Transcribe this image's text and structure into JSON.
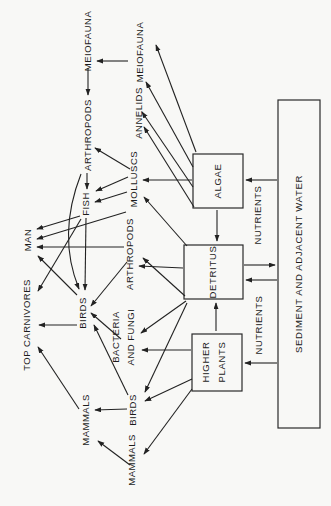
{
  "diagram_title": "Estuarine food web (rotated page)",
  "nodes": {
    "meiofauna_upper": {
      "label": "MEIOFAUNA"
    },
    "arthropods_upper": {
      "label": "ARTHROPODS"
    },
    "fish": {
      "label": "FISH"
    },
    "man": {
      "label": "MAN"
    },
    "top_carnivores": {
      "label": "TOP CARNIVORES"
    },
    "birds_upper": {
      "label": "BIRDS"
    },
    "mammals_upper": {
      "label": "MAMMALS"
    },
    "meiofauna_lower": {
      "label": "MEIOFAUNA"
    },
    "annelids": {
      "label": "ANNELIDS"
    },
    "molluscs": {
      "label": "MOLLUSCS"
    },
    "arthropods_lower": {
      "label": "ARTHROPODS"
    },
    "bacteria_fungi": {
      "label_line1": "BACTERIA",
      "label_line2": "AND FUNGI"
    },
    "birds_lower": {
      "label": "BIRDS"
    },
    "mammals_lower": {
      "label": "MAMMALS"
    },
    "nutrients_upper": {
      "label": "NUTRIENTS"
    },
    "nutrients_lower": {
      "label": "NUTRIENTS"
    }
  },
  "boxes": {
    "algae": {
      "label": "ALGAE"
    },
    "detritus": {
      "label": "DETRITUS"
    },
    "higher_plants": {
      "label_line1": "HIGHER",
      "label_line2": "PLANTS"
    },
    "sediment": {
      "label": "SEDIMENT AND ADJACENT WATER"
    }
  },
  "colors": {
    "ink": "#222222",
    "paper": "#f8f8f6"
  },
  "arrows": [
    {
      "from": "meiofauna-lower",
      "to": "meiofauna-upper",
      "x1": 128,
      "y1": 61,
      "x2": 97,
      "y2": 61
    },
    {
      "from": "meiofauna-upper",
      "to": "arthropods-upper",
      "x1": 88,
      "y1": 68,
      "x2": 88,
      "y2": 95
    },
    {
      "from": "arthropods-upper",
      "to": "fish",
      "x1": 87,
      "y1": 173,
      "x2": 87,
      "y2": 189
    },
    {
      "from": "fish",
      "to": "birds-upper",
      "x1": 86,
      "y1": 218,
      "x2": 85,
      "y2": 290
    },
    {
      "from": "algae",
      "to": "detritus",
      "x1": 217,
      "y1": 210,
      "x2": 217,
      "y2": 241
    },
    {
      "from": "higher-plants",
      "to": "detritus",
      "x1": 216,
      "y1": 331,
      "x2": 216,
      "y2": 303
    },
    {
      "from": "sediment",
      "to": "algae",
      "x1": 277,
      "y1": 180,
      "x2": 246,
      "y2": 180
    },
    {
      "from": "detritus",
      "to": "sediment",
      "x1": 244,
      "y1": 265,
      "x2": 275,
      "y2": 265
    },
    {
      "from": "sediment",
      "to": "detritus",
      "x1": 277,
      "y1": 280,
      "x2": 246,
      "y2": 280
    },
    {
      "from": "sediment",
      "to": "higher-plants",
      "x1": 277,
      "y1": 363,
      "x2": 245,
      "y2": 363
    },
    {
      "from": "arthropods-lower",
      "to": "man",
      "x1": 124,
      "y1": 247,
      "x2": 37,
      "y2": 247
    },
    {
      "from": "birds-lower",
      "to": "mammals-upper",
      "x1": 127,
      "y1": 409,
      "x2": 95,
      "y2": 410
    },
    {
      "from": "birds-upper",
      "to": "top-carnivores",
      "x1": 77,
      "y1": 325,
      "x2": 39,
      "y2": 325
    },
    {
      "from": "algae",
      "to": "meiofauna-lower",
      "x1": 196,
      "y1": 152,
      "x2": 156,
      "y2": 45
    },
    {
      "from": "algae",
      "to": "meiofauna-lower",
      "x1": 193,
      "y1": 167,
      "x2": 146,
      "y2": 82
    },
    {
      "from": "algae",
      "to": "annelids",
      "x1": 193,
      "y1": 187,
      "x2": 142,
      "y2": 112
    },
    {
      "from": "algae",
      "to": "annelids",
      "x1": 194,
      "y1": 207,
      "x2": 144,
      "y2": 127
    },
    {
      "from": "algae",
      "to": "molluscs",
      "x1": 192,
      "y1": 180,
      "x2": 143,
      "y2": 180
    },
    {
      "from": "detritus",
      "to": "molluscs",
      "x1": 187,
      "y1": 246,
      "x2": 144,
      "y2": 197
    },
    {
      "from": "detritus",
      "to": "arthropods-lower",
      "x1": 183,
      "y1": 268,
      "x2": 139,
      "y2": 266
    },
    {
      "from": "detritus",
      "to": "arthropods-lower",
      "x1": 185,
      "y1": 296,
      "x2": 143,
      "y2": 258
    },
    {
      "from": "detritus",
      "to": "bacteria-fungi",
      "x1": 186,
      "y1": 301,
      "x2": 141,
      "y2": 333
    },
    {
      "from": "higher-plants",
      "to": "bacteria-fungi",
      "x1": 191,
      "y1": 350,
      "x2": 142,
      "y2": 350
    },
    {
      "from": "detritus",
      "to": "birds-lower",
      "x1": 187,
      "y1": 303,
      "x2": 145,
      "y2": 392
    },
    {
      "from": "higher-plants",
      "to": "birds-lower",
      "x1": 192,
      "y1": 379,
      "x2": 145,
      "y2": 401
    },
    {
      "from": "higher-plants",
      "to": "mammals-lower",
      "x1": 192,
      "y1": 389,
      "x2": 144,
      "y2": 454
    },
    {
      "from": "mammals-lower",
      "to": "mammals-upper",
      "x1": 130,
      "y1": 465,
      "x2": 98,
      "y2": 441
    },
    {
      "from": "mammals-upper",
      "to": "top-carnivores",
      "x1": 79,
      "y1": 409,
      "x2": 38,
      "y2": 347
    },
    {
      "from": "molluscs",
      "to": "fish",
      "x1": 128,
      "y1": 177,
      "x2": 96,
      "y2": 191
    },
    {
      "from": "molluscs",
      "to": "fish",
      "x1": 127,
      "y1": 192,
      "x2": 95,
      "y2": 202
    },
    {
      "from": "molluscs",
      "to": "arthropods-upper",
      "x1": 130,
      "y1": 169,
      "x2": 95,
      "y2": 148
    },
    {
      "from": "molluscs",
      "to": "man",
      "x1": 126,
      "y1": 212,
      "x2": 37,
      "y2": 239
    },
    {
      "from": "fish",
      "to": "man",
      "x1": 80,
      "y1": 216,
      "x2": 37,
      "y2": 229
    },
    {
      "from": "birds-upper",
      "to": "man",
      "x1": 77,
      "y1": 295,
      "x2": 38,
      "y2": 256
    },
    {
      "from": "fish",
      "to": "top-carnivores",
      "x1": 81,
      "y1": 219,
      "x2": 38,
      "y2": 291
    },
    {
      "from": "arthropods-lower",
      "to": "birds-upper",
      "x1": 127,
      "y1": 262,
      "x2": 91,
      "y2": 306
    },
    {
      "from": "bacteria-fungi",
      "to": "birds-upper",
      "x1": 121,
      "y1": 339,
      "x2": 91,
      "y2": 313
    },
    {
      "from": "birds-lower",
      "to": "birds-upper",
      "x1": 128,
      "y1": 395,
      "x2": 94,
      "y2": 325
    },
    {
      "from": "arthropods-upper",
      "to": "birds-upper",
      "curve": "M 81,174 Q 57,235 79,289"
    }
  ]
}
